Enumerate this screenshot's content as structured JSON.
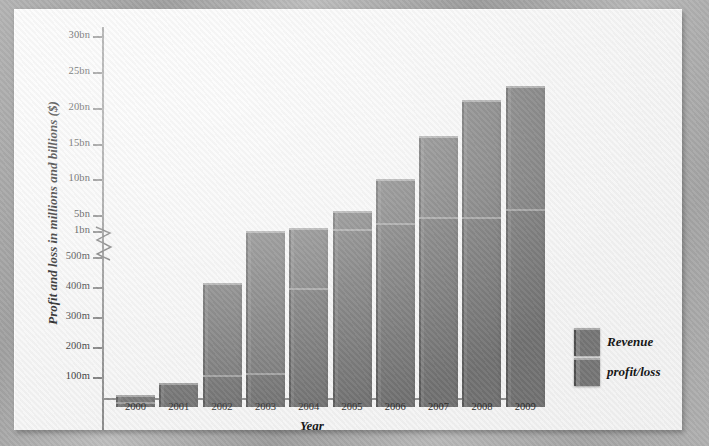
{
  "chart_data": {
    "type": "bar",
    "title": "",
    "xlabel": "Year",
    "ylabel": "Profit and loss in millions and billions ($)",
    "categories": [
      "2000",
      "2001",
      "2002",
      "2003",
      "2004",
      "2005",
      "2006",
      "2007",
      "2008",
      "2009"
    ],
    "series": [
      {
        "name": "Revenue",
        "values": [
          40,
          75,
          415,
          1100,
          1700,
          5500,
          10000,
          16000,
          21000,
          23000
        ]
      },
      {
        "name": "profit/loss",
        "values": [
          10,
          75,
          100,
          105,
          390,
          1100,
          2500,
          4000,
          4000,
          5500
        ]
      }
    ],
    "value_units": "millions of dollars",
    "legend": [
      "Revenue",
      "profit/loss"
    ],
    "legend_position": "right",
    "grid": false,
    "axis_break": {
      "between": [
        "500m",
        "1bn"
      ],
      "style": "zigzag"
    },
    "ytick_labels": [
      "30bn",
      "25bn",
      "20bn",
      "15bn",
      "10bn",
      "5bn",
      "1bn",
      "500m",
      "400m",
      "300m",
      "200m",
      "100m",
      "-100m"
    ],
    "ytick_values": [
      30000,
      25000,
      20000,
      15000,
      10000,
      5000,
      1000,
      500,
      400,
      300,
      200,
      100,
      -100
    ],
    "ytick_y": [
      27,
      63,
      99,
      135,
      170,
      206,
      222,
      248,
      278,
      308,
      338,
      368,
      428
    ],
    "zero_y": 398,
    "ylim_lower": [
      -100,
      500
    ],
    "ylim_upper": [
      1000,
      30000
    ]
  },
  "legend": {
    "items": [
      {
        "label": "Revenue"
      },
      {
        "label": "profit/loss"
      }
    ]
  }
}
